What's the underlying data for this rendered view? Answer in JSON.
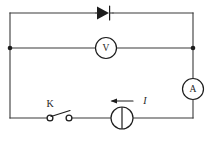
{
  "figure": {
    "kind": "electrical-circuit-schematic",
    "background_color": "#ffffff",
    "wire_color": "#3a3a3a",
    "symbol_color": "#1d1d1d",
    "width": 215,
    "height": 143
  },
  "labels": {
    "voltmeter": "V",
    "ammeter": "A",
    "switch": "K",
    "current": "I"
  },
  "components": [
    {
      "name": "diode",
      "symbol": "triangle-with-bar",
      "branch": "top-wire",
      "label": ""
    },
    {
      "name": "voltmeter",
      "symbol": "circle-letter",
      "branch": "middle-wire",
      "label": "V"
    },
    {
      "name": "ammeter",
      "symbol": "circle-letter",
      "branch": "right-wire",
      "label": "A"
    },
    {
      "name": "switch",
      "symbol": "open-switch",
      "branch": "bottom-wire",
      "label": "K"
    },
    {
      "name": "source",
      "symbol": "circle-with-vertical-bar",
      "branch": "bottom-wire",
      "label": ""
    },
    {
      "name": "current-arrow",
      "symbol": "arrow-left",
      "branch": "above-source",
      "label": "I"
    }
  ],
  "junctions": [
    {
      "name": "left-junction",
      "x": 10,
      "y": 48
    },
    {
      "name": "right-junction",
      "x": 193,
      "y": 48
    }
  ]
}
